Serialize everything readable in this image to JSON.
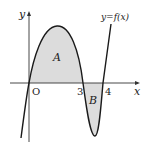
{
  "diagram": {
    "curve_label": "y=f(x)",
    "x_axis_label": "x",
    "y_axis_label": "y",
    "origin_label": "O",
    "tick_labels": [
      "3",
      "4"
    ],
    "region_labels": [
      "A",
      "B"
    ],
    "colors": {
      "axis": "#333333",
      "curve": "#1a1a1a",
      "shade": "#dcdcdc",
      "background": "#ffffff"
    }
  }
}
